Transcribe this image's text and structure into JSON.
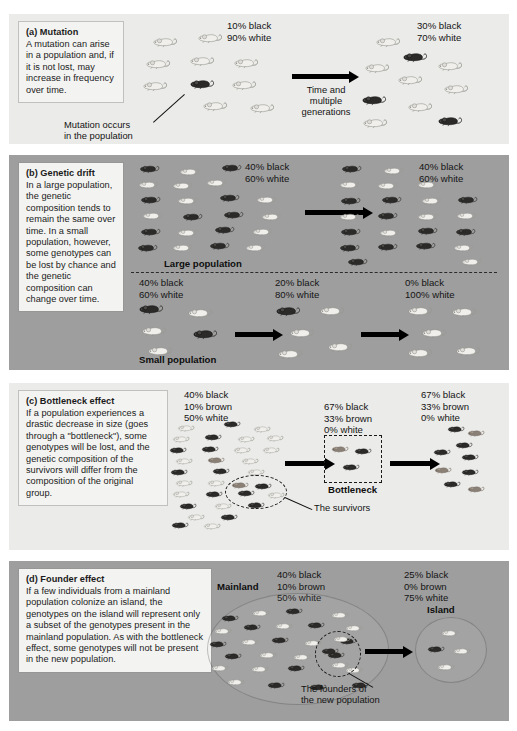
{
  "figure": {
    "panel_bg_light": "#ebebe9",
    "panel_bg_dark": "#9e9e9e",
    "caption_bg": "#f3f3f1",
    "mouse_colors": {
      "black": "#2b2a28",
      "brown": "#8a8076",
      "white": "#f0efeb"
    }
  },
  "panels": [
    {
      "id": "a",
      "label": "(a) Mutation",
      "body": "A mutation can arise in a population and, if it is not lost, may increase in frequency over time.",
      "tone": "light",
      "left_stats": [
        "10% black",
        "90% white"
      ],
      "right_stats": [
        "30% black",
        "70% white"
      ],
      "arrow_label": [
        "Time and",
        "multiple",
        "generations"
      ],
      "annotation": [
        "Mutation occurs",
        "in the population"
      ]
    },
    {
      "id": "b",
      "label": "(b) Genetic drift",
      "body": "In a large population, the genetic composition tends to remain the same over time. In a small population, however, some genotypes can be lost by chance and the genetic composition can change over time.",
      "tone": "dark",
      "large_label": "Large population",
      "small_label": "Small population",
      "large_left_stats": [
        "40% black",
        "60% white"
      ],
      "large_right_stats": [
        "40% black",
        "60% white"
      ],
      "small_left_stats": [
        "40% black",
        "60% white"
      ],
      "small_mid_stats": [
        "20% black",
        "80% white"
      ],
      "small_right_stats": [
        "0% black",
        "100% white"
      ]
    },
    {
      "id": "c",
      "label": "(c) Bottleneck effect",
      "body": "If a population experiences a drastic decrease in size (goes through a \"bottleneck\"), some genotypes will be lost, and the genetic composition of the survivors will differ from the composition of the original group.",
      "tone": "light",
      "left_stats": [
        "40% black",
        "10% brown",
        "50% white"
      ],
      "mid_stats": [
        "67% black",
        "33% brown",
        "0% white"
      ],
      "right_stats": [
        "67% black",
        "33% brown",
        "0% white"
      ],
      "bottleneck_label": "Bottleneck",
      "survivors_label": "The survivors"
    },
    {
      "id": "d",
      "label": "(d) Founder effect",
      "body": "If a few individuals from a mainland population colonize an island, the genotypes on the island will represent only a subset of the genotypes present in the mainland population. As with the bottleneck effect, some genotypes will not be present in the new population.",
      "tone": "dark",
      "mainland_label": "Mainland",
      "island_label": "Island",
      "left_stats": [
        "40% black",
        "10% brown",
        "50% white"
      ],
      "right_stats": [
        "25% black",
        "0% brown",
        "75% white"
      ],
      "founders_label": [
        "The founders of",
        "the new population"
      ]
    }
  ],
  "chart_data": {
    "type": "diagram",
    "panels": [
      {
        "name": "Mutation",
        "stages": [
          {
            "stage": "before",
            "black_pct": 10,
            "white_pct": 90,
            "brown_pct": 0
          },
          {
            "stage": "after",
            "black_pct": 30,
            "white_pct": 70,
            "brown_pct": 0
          }
        ]
      },
      {
        "name": "Genetic drift - large population",
        "stages": [
          {
            "stage": "before",
            "black_pct": 40,
            "white_pct": 60,
            "brown_pct": 0
          },
          {
            "stage": "after",
            "black_pct": 40,
            "white_pct": 60,
            "brown_pct": 0
          }
        ]
      },
      {
        "name": "Genetic drift - small population",
        "stages": [
          {
            "stage": "gen1",
            "black_pct": 40,
            "white_pct": 60,
            "brown_pct": 0
          },
          {
            "stage": "gen2",
            "black_pct": 20,
            "white_pct": 80,
            "brown_pct": 0
          },
          {
            "stage": "gen3",
            "black_pct": 0,
            "white_pct": 100,
            "brown_pct": 0
          }
        ]
      },
      {
        "name": "Bottleneck effect",
        "stages": [
          {
            "stage": "original",
            "black_pct": 40,
            "brown_pct": 10,
            "white_pct": 50
          },
          {
            "stage": "bottleneck",
            "black_pct": 67,
            "brown_pct": 33,
            "white_pct": 0
          },
          {
            "stage": "after",
            "black_pct": 67,
            "brown_pct": 33,
            "white_pct": 0
          }
        ]
      },
      {
        "name": "Founder effect",
        "stages": [
          {
            "stage": "mainland",
            "black_pct": 40,
            "brown_pct": 10,
            "white_pct": 50
          },
          {
            "stage": "island",
            "black_pct": 25,
            "brown_pct": 0,
            "white_pct": 75
          }
        ]
      }
    ]
  }
}
